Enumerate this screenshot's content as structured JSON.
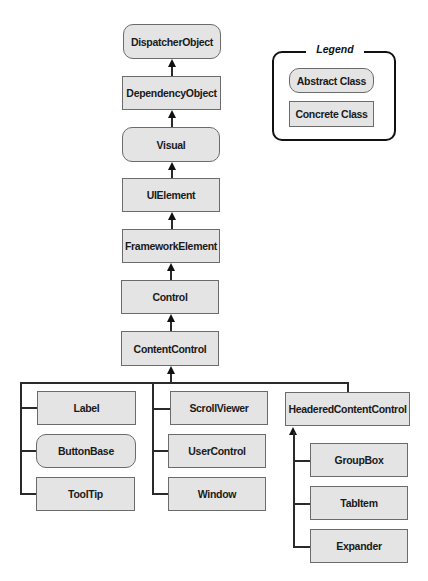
{
  "legend": {
    "title": "Legend",
    "abstract_label": "Abstract Class",
    "concrete_label": "Concrete Class"
  },
  "nodes": {
    "dispatcher_object": {
      "label": "DispatcherObject",
      "kind": "abstract"
    },
    "dependency_object": {
      "label": "DependencyObject",
      "kind": "concrete"
    },
    "visual": {
      "label": "Visual",
      "kind": "abstract"
    },
    "ui_element": {
      "label": "UIElement",
      "kind": "concrete"
    },
    "framework_element": {
      "label": "FrameworkElement",
      "kind": "concrete"
    },
    "control": {
      "label": "Control",
      "kind": "concrete"
    },
    "content_control": {
      "label": "ContentControl",
      "kind": "concrete"
    },
    "label": {
      "label": "Label",
      "kind": "concrete"
    },
    "button_base": {
      "label": "ButtonBase",
      "kind": "abstract"
    },
    "tool_tip": {
      "label": "ToolTip",
      "kind": "concrete"
    },
    "scroll_viewer": {
      "label": "ScrollViewer",
      "kind": "concrete"
    },
    "user_control": {
      "label": "UserControl",
      "kind": "concrete"
    },
    "window": {
      "label": "Window",
      "kind": "concrete"
    },
    "headered_content_control": {
      "label": "HeaderedContentControl",
      "kind": "concrete"
    },
    "group_box": {
      "label": "GroupBox",
      "kind": "concrete"
    },
    "tab_item": {
      "label": "TabItem",
      "kind": "concrete"
    },
    "expander": {
      "label": "Expander",
      "kind": "concrete"
    }
  },
  "edges": [
    [
      "DependencyObject",
      "DispatcherObject"
    ],
    [
      "Visual",
      "DependencyObject"
    ],
    [
      "UIElement",
      "Visual"
    ],
    [
      "FrameworkElement",
      "UIElement"
    ],
    [
      "Control",
      "FrameworkElement"
    ],
    [
      "ContentControl",
      "Control"
    ],
    [
      "Label",
      "ContentControl"
    ],
    [
      "ButtonBase",
      "ContentControl"
    ],
    [
      "ToolTip",
      "ContentControl"
    ],
    [
      "ScrollViewer",
      "ContentControl"
    ],
    [
      "UserControl",
      "ContentControl"
    ],
    [
      "Window",
      "ContentControl"
    ],
    [
      "HeaderedContentControl",
      "ContentControl"
    ],
    [
      "GroupBox",
      "HeaderedContentControl"
    ],
    [
      "TabItem",
      "HeaderedContentControl"
    ],
    [
      "Expander",
      "HeaderedContentControl"
    ]
  ],
  "colors": {
    "box_fill": "#e4e4e4",
    "box_border": "#6b6b6b",
    "line": "#2a2a2a"
  }
}
